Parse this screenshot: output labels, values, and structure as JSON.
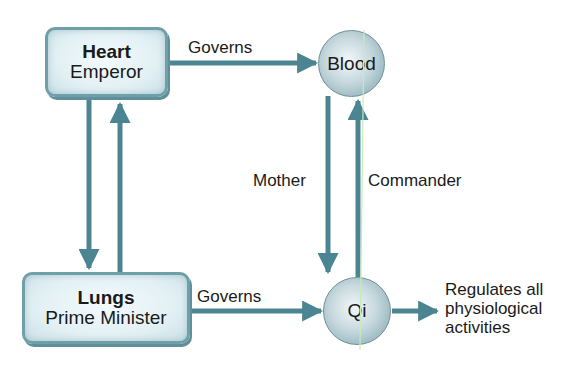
{
  "nodes": {
    "heart": {
      "title": "Heart",
      "subtitle": "Emperor"
    },
    "lungs": {
      "title": "Lungs",
      "subtitle": "Prime Minister"
    },
    "blood": {
      "label": "Blood"
    },
    "qi": {
      "label": "Qi"
    }
  },
  "edges": {
    "heart_to_blood": "Governs",
    "lungs_to_qi": "Governs",
    "blood_to_qi": "Mother",
    "qi_to_blood": "Commander",
    "qi_output": [
      "Regulates all",
      "physiological",
      "activities"
    ]
  },
  "colors": {
    "arrow": "#4a8591",
    "box_border": "#6f9fa8",
    "highlight_line": "#b8e6b0"
  }
}
